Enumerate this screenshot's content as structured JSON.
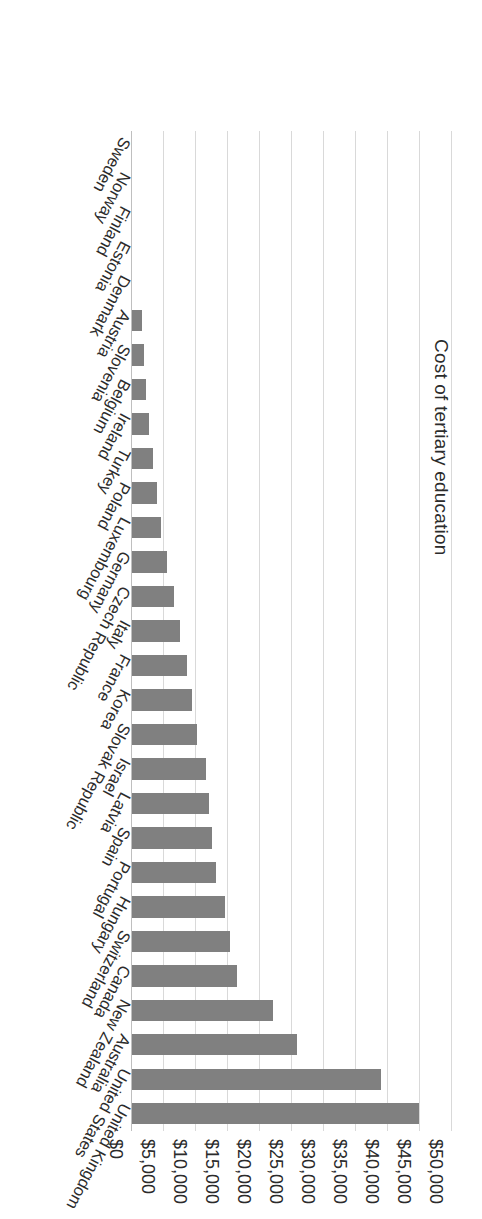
{
  "chart_data": {
    "type": "bar",
    "orientation": "horizontal",
    "title": "",
    "xlabel": "Cost of tertiary education",
    "ylabel": "",
    "xlim": [
      0,
      50000
    ],
    "grid": true,
    "legend": "none",
    "tick_format": "$#,##0",
    "ticks": [
      "$0",
      "$5,000",
      "$10,000",
      "$15,000",
      "$20,000",
      "$25,000",
      "$30,000",
      "$35,000",
      "$40,000",
      "$45,000",
      "$50,000"
    ],
    "tick_values": [
      0,
      5000,
      10000,
      15000,
      20000,
      25000,
      30000,
      35000,
      40000,
      45000,
      50000
    ],
    "categories": [
      "United Kingdom",
      "United States",
      "Australia",
      "New Zealand",
      "Canada",
      "Switzerland",
      "Hungary",
      "Portugal",
      "Spain",
      "Latvia",
      "Israel",
      "Slovak Republic",
      "Korea",
      "France",
      "Italy",
      "Czech Republic",
      "Germany",
      "Luxembourg",
      "Poland",
      "Turkey",
      "Ireland",
      "Belgium",
      "Slovenia",
      "Austria",
      "Denmark",
      "Estonia",
      "Finland",
      "Norway",
      "Sweden"
    ],
    "values": [
      44800,
      38900,
      25800,
      22000,
      16400,
      15300,
      14600,
      13200,
      12500,
      12100,
      11600,
      10200,
      9300,
      8600,
      7500,
      6500,
      5500,
      4600,
      3900,
      3300,
      2700,
      2200,
      1800,
      1500,
      0,
      0,
      0,
      0,
      0
    ],
    "series": [
      {
        "name": "Cost of tertiary education",
        "color": "#808080",
        "values": [
          44800,
          38900,
          25800,
          22000,
          16400,
          15300,
          14600,
          13200,
          12500,
          12100,
          11600,
          10200,
          9300,
          8600,
          7500,
          6500,
          5500,
          4600,
          3900,
          3300,
          2700,
          2200,
          1800,
          1500,
          0,
          0,
          0,
          0,
          0
        ]
      }
    ]
  },
  "colors": {
    "bar": "#808080",
    "gridline": "#d9d9d9",
    "baseline": "#bfbfbf",
    "text": "#2b2b2b",
    "background": "#ffffff"
  }
}
